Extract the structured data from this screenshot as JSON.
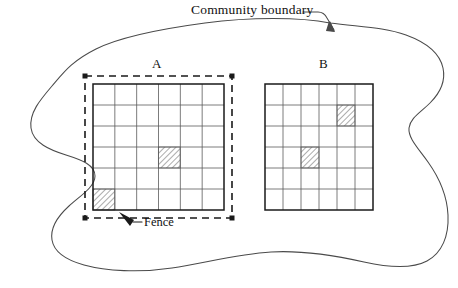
{
  "figure": {
    "type": "schematic-diagram",
    "background_color": "#ffffff",
    "ink_color": "#1a1a1a",
    "boundary_line_color": "#4a4a4a",
    "width": 458,
    "height": 288
  },
  "annotations": {
    "community_boundary_label": "Community boundary",
    "fence_label": "Fence",
    "cutoff_text_above": ""
  },
  "plots": [
    {
      "id": "A",
      "label": "A",
      "rows": 6,
      "cols": 6,
      "has_fence": true,
      "fence_style": "dashed",
      "shaded_cells": [
        {
          "row": 4,
          "col": 4
        },
        {
          "row": 6,
          "col": 1
        }
      ],
      "bounds": {
        "x": 93,
        "y": 84,
        "width": 131,
        "height": 126
      },
      "fence_bounds": {
        "x": 85,
        "y": 76,
        "width": 147,
        "height": 142
      }
    },
    {
      "id": "B",
      "label": "B",
      "rows": 6,
      "cols": 6,
      "has_fence": false,
      "fence_style": "none",
      "shaded_cells": [
        {
          "row": 2,
          "col": 5
        },
        {
          "row": 4,
          "col": 3
        }
      ],
      "bounds": {
        "x": 265,
        "y": 84,
        "width": 108,
        "height": 126
      },
      "fence_bounds": null
    }
  ],
  "legend": {
    "shaded_cell_meaning": "hatched plot",
    "hatch_pattern": "diagonal-lines"
  }
}
